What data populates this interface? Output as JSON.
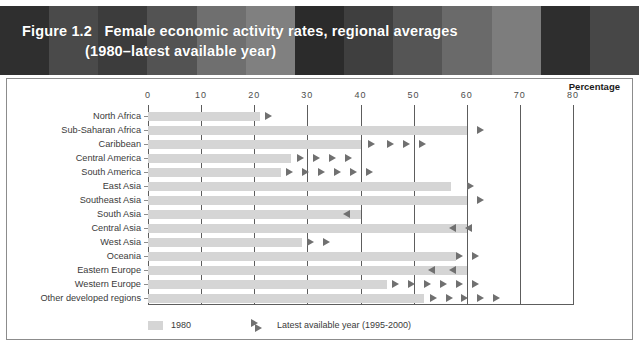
{
  "figure": {
    "number": "Figure 1.2",
    "title_line1": "Figure 1.2   Female economic activity rates, regional averages",
    "title_line2": "(1980–latest available year)",
    "percentage_label": "Percentage",
    "header_stripe_colors": [
      "#2f2f2f",
      "#4a4a4a",
      "#3c3c3c",
      "#535353",
      "#6f6f6f",
      "#808080",
      "#2b2b2b",
      "#3f3f3f",
      "#555555",
      "#6a6a6a",
      "#7d7d7d",
      "#2e2e2e",
      "#474747"
    ],
    "bar_color": "#d5d5d5",
    "marker_color": "#707070",
    "panel_border_color": "#8c8c8c",
    "grid_color": "#5d5d5d"
  },
  "legend": {
    "series1_label": "1980",
    "series2_label": "Latest available year (1995-2000)"
  },
  "chart_data": {
    "type": "bar",
    "orientation": "horizontal",
    "title": "Female economic activity rates, regional averages (1980–latest available year)",
    "xlabel": "Percentage",
    "ylabel": "",
    "xlim": [
      0,
      80
    ],
    "xticks": [
      0,
      10,
      20,
      30,
      40,
      50,
      60,
      70,
      80
    ],
    "xtick_labels": [
      "0",
      "10",
      "20",
      "30",
      "40",
      "50",
      "60",
      "70",
      "80"
    ],
    "grid": true,
    "legend_position": "bottom-left",
    "categories": [
      "North Africa",
      "Sub-Saharan Africa",
      "Caribbean",
      "Central America",
      "South America",
      "East Asia",
      "Southeast Asia",
      "South Asia",
      "Central Asia",
      "West Asia",
      "Oceania",
      "Eastern Europe",
      "Western Europe",
      "Other developed regions"
    ],
    "series": [
      {
        "name": "1980",
        "values": [
          21,
          60,
          40,
          27,
          25,
          57,
          60,
          40,
          60,
          29,
          58,
          60,
          45,
          52
        ]
      },
      {
        "name": "Latest available year (1995-2000)",
        "values": [
          22,
          62,
          51,
          37,
          41,
          60,
          62,
          38,
          58,
          33,
          61,
          58,
          61,
          65
        ],
        "note": "Shown as arrow markers; right-pointing arrows denote increase, left-pointing arrows denote decrease."
      }
    ],
    "markers": [
      {
        "category": "North Africa",
        "direction": "right",
        "positions": [
          22
        ]
      },
      {
        "category": "Sub-Saharan Africa",
        "direction": "right",
        "positions": [
          62
        ]
      },
      {
        "category": "Caribbean",
        "direction": "right",
        "positions": [
          41.5,
          45,
          48,
          51
        ]
      },
      {
        "category": "Central America",
        "direction": "right",
        "positions": [
          28,
          31,
          34,
          37
        ]
      },
      {
        "category": "South America",
        "direction": "right",
        "positions": [
          26,
          29,
          32,
          35,
          38,
          41
        ]
      },
      {
        "category": "East Asia",
        "direction": "right",
        "positions": [
          60
        ]
      },
      {
        "category": "Southeast Asia",
        "direction": "right",
        "positions": [
          62
        ]
      },
      {
        "category": "South Asia",
        "direction": "left",
        "positions": [
          38
        ]
      },
      {
        "category": "Central Asia",
        "direction": "left",
        "positions": [
          58,
          61
        ]
      },
      {
        "category": "West Asia",
        "direction": "right",
        "positions": [
          30,
          33
        ]
      },
      {
        "category": "Oceania",
        "direction": "right",
        "positions": [
          58,
          61
        ]
      },
      {
        "category": "Eastern Europe",
        "direction": "left",
        "positions": [
          54,
          58
        ]
      },
      {
        "category": "Western Europe",
        "direction": "right",
        "positions": [
          46,
          49,
          52,
          55,
          58,
          61
        ]
      },
      {
        "category": "Other developed regions",
        "direction": "right",
        "positions": [
          53,
          56,
          59,
          62,
          65
        ]
      }
    ]
  }
}
